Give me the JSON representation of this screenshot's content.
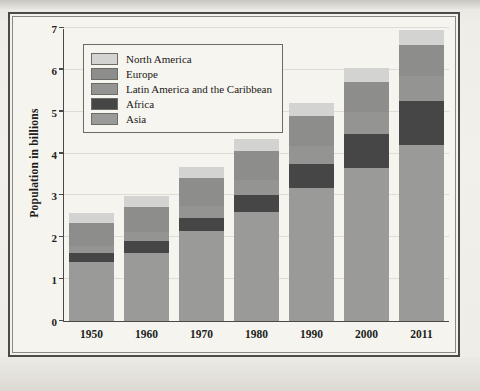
{
  "chart_data": {
    "type": "bar",
    "subtype": "stacked",
    "title": "",
    "xlabel": "",
    "ylabel": "Population in billions",
    "categories": [
      "1950",
      "1960",
      "1970",
      "1980",
      "1990",
      "2000",
      "2011"
    ],
    "ylim": [
      0,
      7
    ],
    "yticks": [
      "0",
      "1",
      "2",
      "3",
      "4",
      "5",
      "6",
      "7"
    ],
    "grid": true,
    "legend_position": "upper-left-inside",
    "stack_order_bottom_to_top": [
      "Asia",
      "Africa",
      "Latin America and the Caribbean",
      "Europe",
      "North America"
    ],
    "series": [
      {
        "name": "Asia",
        "color": "#9a9a99",
        "values": [
          1.4,
          1.63,
          2.14,
          2.61,
          3.18,
          3.65,
          4.21
        ]
      },
      {
        "name": "Africa",
        "color": "#464646",
        "values": [
          0.23,
          0.28,
          0.32,
          0.41,
          0.57,
          0.82,
          1.05
        ]
      },
      {
        "name": "Latin America and the Caribbean",
        "color": "#949493",
        "values": [
          0.17,
          0.22,
          0.29,
          0.36,
          0.44,
          0.52,
          0.6
        ]
      },
      {
        "name": "Europe",
        "color": "#8d8d8c",
        "values": [
          0.55,
          0.6,
          0.66,
          0.69,
          0.72,
          0.73,
          0.74
        ]
      },
      {
        "name": "North America",
        "color": "#d3d3d1",
        "values": [
          0.23,
          0.25,
          0.27,
          0.29,
          0.31,
          0.33,
          0.35
        ]
      }
    ],
    "totals": [
      2.53,
      2.98,
      3.68,
      4.36,
      5.28,
      6.11,
      6.97
    ]
  },
  "legend": {
    "items": [
      {
        "label": "North America",
        "color": "#d3d3d1"
      },
      {
        "label": "Europe",
        "color": "#8d8d8c"
      },
      {
        "label": "Latin America and the Caribbean",
        "color": "#949493"
      },
      {
        "label": "Africa",
        "color": "#464646"
      },
      {
        "label": "Asia",
        "color": "#9a9a99"
      }
    ]
  },
  "axis": {
    "y_title": "Population in billions"
  }
}
